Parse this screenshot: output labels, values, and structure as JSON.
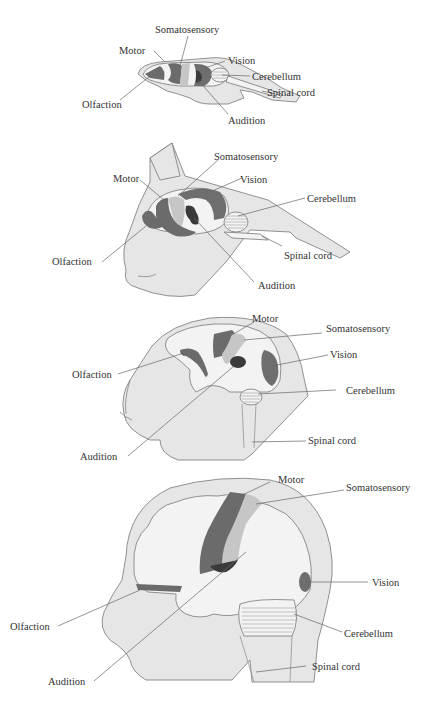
{
  "colors": {
    "body_fill": "#e6e6e6",
    "brain_fill": "#f3f3f3",
    "motor": "#6b6b6b",
    "somatosensory": "#c6c6c6",
    "vision": "#6e6e6e",
    "audition": "#3a3a3a",
    "olfaction": "#6b6b6b",
    "outline": "#777777",
    "label": "#333333"
  },
  "diagrams": [
    {
      "id": "rat",
      "labels": {
        "somatosensory": "Somatosensory",
        "motor": "Motor",
        "vision": "Vision",
        "cerebellum": "Cerebellum",
        "spinal_cord": "Spinal cord",
        "olfaction": "Olfaction",
        "audition": "Audition"
      }
    },
    {
      "id": "cat",
      "labels": {
        "somatosensory": "Somatosensory",
        "motor": "Motor",
        "vision": "Vision",
        "cerebellum": "Cerebellum",
        "spinal_cord": "Spinal cord",
        "olfaction": "Olfaction",
        "audition": "Audition"
      }
    },
    {
      "id": "monkey",
      "labels": {
        "motor": "Motor",
        "somatosensory": "Somatosensory",
        "vision": "Vision",
        "olfaction": "Olfaction",
        "cerebellum": "Cerebellum",
        "spinal_cord": "Spinal cord",
        "audition": "Audition"
      }
    },
    {
      "id": "human",
      "labels": {
        "motor": "Motor",
        "somatosensory": "Somatosensory",
        "vision": "Vision",
        "olfaction": "Olfaction",
        "cerebellum": "Cerebellum",
        "spinal_cord": "Spinal cord",
        "audition": "Audition"
      }
    }
  ]
}
